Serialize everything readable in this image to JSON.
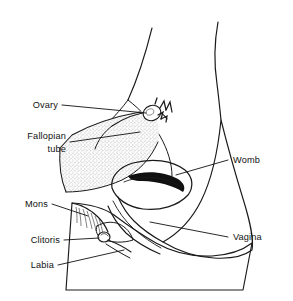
{
  "figure": {
    "background_color": "#ffffff",
    "line_color": "#1a1a1a",
    "shade_gray": "#a8a8a8",
    "stipple_gray": "#cfcfcf"
  },
  "labels": {
    "ovary": "Ovary",
    "fallopian_line1": "Fallopian",
    "fallopian_line2": "tube",
    "mons": "Mons",
    "clitoris": "Clitoris",
    "labia": "Labia",
    "womb": "Womb",
    "vagina": "Vagina"
  },
  "parts": {
    "body_outline": "body-contour",
    "uterus": "womb-body",
    "uterine_cavity": "womb-cavity",
    "broad_ligament": "broad-ligament",
    "ovary_shape": "ovary-organ",
    "fimbriae": "fimbriae-fringe",
    "fallopian_tube": "fallopian-tube",
    "vaginal_canal": "vagina-canal",
    "mons_pubis": "mons-pubis",
    "clitoris_shape": "clitoris-organ",
    "labia_shape": "labia-folds",
    "thigh_mass": "thigh-shaded-region"
  }
}
